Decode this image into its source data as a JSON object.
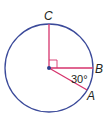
{
  "diagram": {
    "type": "circle-geometry",
    "circle": {
      "cx": 49,
      "cy": 68,
      "r": 44,
      "stroke": "#3b4a9a"
    },
    "radii_color": "#d6336c",
    "center_dot_color": "#2b3f8c",
    "points": [
      {
        "name": "C",
        "label": "C"
      },
      {
        "name": "B",
        "label": "B"
      },
      {
        "name": "A",
        "label": "A"
      }
    ],
    "angle_label": "30°",
    "right_angle_marker": "right angle between CO and OB"
  }
}
